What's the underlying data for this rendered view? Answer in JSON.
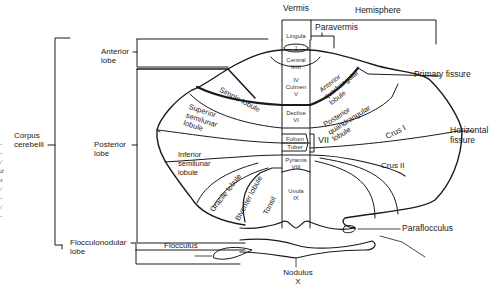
{
  "figure": {
    "colors": {
      "background": "#ffffff",
      "line": "#1a1a1a",
      "text": "#1a1a1a"
    }
  },
  "headers": {
    "vermis": "Vermis",
    "hemisphere": "Hemisphere",
    "paravermis": "Paravermis"
  },
  "left_labels": {
    "corpus_cerebelli": "Corpus\ncerebelli",
    "anterior_lobe": "Anterior\nlobe",
    "posterior_lobe": "Posterior\nlobe",
    "flocculonodular_lobe": "Flocculonodular\nlobe",
    "flocculus": "Flocculus"
  },
  "vermis_lobules": {
    "lingula": "Lingula",
    "i": "I",
    "central": "Central\nII/III",
    "culmen": "IV\nCulmen\nV",
    "declive": "Declive\nVI",
    "folium": "Folium",
    "tuber": "Tuber",
    "vii": "VII",
    "pyramis": "Pyramis\nVIII",
    "uvula": "Uvula\nIX",
    "nodulus": "Nodulus\nX"
  },
  "hemisphere_lobules": {
    "anterior_quadrangular": "Anterior\nquadrangular\nlobule",
    "posterior_quadrangular": "Posterior\nquandrangular\nlobule",
    "simple_lobule": "Simple lobule",
    "superior_semilunar": "Superior\nsemilunar\nlobule",
    "inferior_semilunar": "Inferior\nsemilunar\nlobule",
    "crus_i": "Crus I",
    "crus_ii": "Crus II",
    "gracile_lobule": "Gracile lobule",
    "biventer_lobule": "Biventer lobule",
    "tonsil": "Tonsil"
  },
  "right_labels": {
    "primary_fissure": "Primary fissure",
    "horizontal_fissure": "Horizontal\nfissure",
    "paraflocculus": "Paraflocculus"
  },
  "edge_text": "-\n-\n/\nd\ns\n/\n-\n/\n-"
}
